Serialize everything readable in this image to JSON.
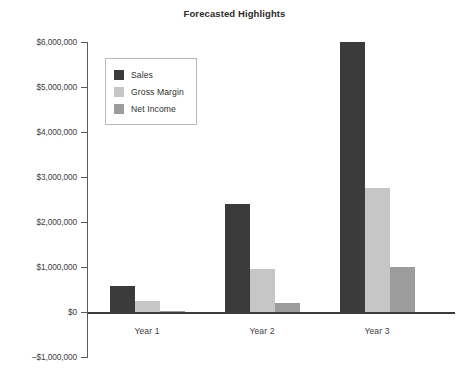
{
  "chart_data": {
    "type": "bar",
    "title": "Forecasted Highlights",
    "xlabel": "",
    "ylabel": "",
    "categories": [
      "Year 1",
      "Year 2",
      "Year 3"
    ],
    "series": [
      {
        "name": "Sales",
        "color": "#3b3b3b",
        "values": [
          580000,
          2390000,
          6000000
        ]
      },
      {
        "name": "Gross Margin",
        "color": "#c6c6c6",
        "values": [
          240000,
          960000,
          2750000
        ]
      },
      {
        "name": "Net Income",
        "color": "#9c9c9c",
        "values": [
          10000,
          210000,
          990000
        ]
      }
    ],
    "ylim": [
      -1000000,
      6000000
    ],
    "ytick_values": [
      6000000,
      5000000,
      4000000,
      3000000,
      2000000,
      1000000,
      0,
      -1000000
    ],
    "ytick_labels": [
      "$6,000,000",
      "$5,000,000",
      "$4,000,000",
      "$3,000,000",
      "$2,000,000",
      "$1,000,000",
      "$0",
      "–$1,000,000"
    ],
    "grid": false,
    "legend_position": "upper-left",
    "background_color": "#ffffff",
    "axis_color": "#5a5a5a"
  }
}
